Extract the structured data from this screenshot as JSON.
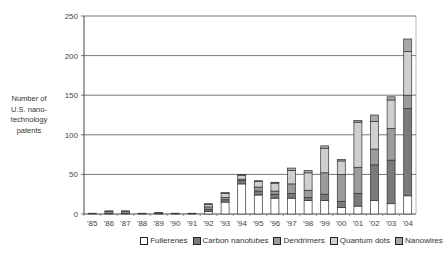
{
  "chart_data": {
    "type": "bar",
    "stacked": true,
    "title": "",
    "xlabel": "",
    "ylabel": "Number of U.S. nanotechnology patents",
    "ylabel_lines": [
      "Number of",
      "U.S. nano-",
      "technology",
      "patents"
    ],
    "ylim": [
      0,
      250
    ],
    "yticks": [
      0,
      50,
      100,
      150,
      200,
      250
    ],
    "grid": true,
    "legend_position": "bottom",
    "categories": [
      "'85",
      "'86",
      "'87",
      "'88",
      "'89",
      "'90",
      "'91",
      "'92",
      "'93",
      "'94",
      "'95",
      "'96",
      "'97",
      "'98",
      "'99",
      "'00",
      "'01",
      "'02",
      "'03",
      "'04"
    ],
    "series": [
      {
        "name": "Fullerenes",
        "color": "#ffffff",
        "values": [
          1,
          1,
          1,
          0,
          1,
          0,
          0,
          3,
          15,
          38,
          24,
          20,
          20,
          17,
          17,
          8,
          10,
          17,
          13,
          23
        ]
      },
      {
        "name": "Carbon nanotubes",
        "color": "#7a7a7a",
        "values": [
          0,
          0,
          0,
          0,
          0,
          0,
          0,
          3,
          3,
          4,
          5,
          5,
          6,
          4,
          8,
          8,
          16,
          45,
          55,
          110
        ]
      },
      {
        "name": "Dendrimers",
        "color": "#9c9c9c",
        "values": [
          0,
          2,
          2,
          1,
          1,
          1,
          1,
          3,
          3,
          2,
          5,
          4,
          12,
          9,
          27,
          34,
          33,
          20,
          40,
          17
        ]
      },
      {
        "name": "Quantum dots",
        "color": "#cfcfcf",
        "values": [
          0,
          0,
          0,
          0,
          0,
          0,
          0,
          3,
          5,
          5,
          7,
          10,
          17,
          22,
          31,
          17,
          57,
          35,
          36,
          55
        ]
      },
      {
        "name": "Nanowires",
        "color": "#a8a8a8",
        "values": [
          0,
          1,
          1,
          0,
          0,
          0,
          0,
          1,
          1,
          1,
          1,
          1,
          3,
          3,
          3,
          2,
          2,
          8,
          4,
          16
        ]
      }
    ]
  },
  "labels": {
    "ylabel_lines": [
      "Number of",
      "U.S. nano-",
      "technology",
      "patents"
    ]
  }
}
